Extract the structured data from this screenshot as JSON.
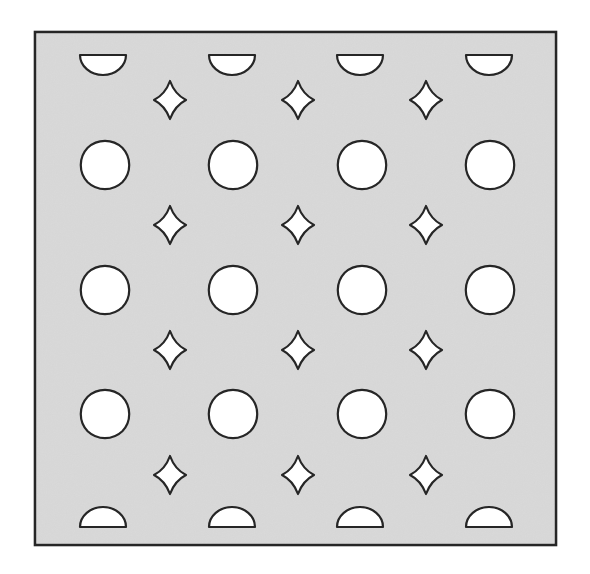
{
  "figure": {
    "title": "Decorative perforated panel pattern",
    "canvas": {
      "width": 590,
      "height": 574
    },
    "page_background": "#ffffff"
  },
  "panel": {
    "name": "perforated-panel",
    "x": 35,
    "y": 32,
    "width": 521,
    "height": 513,
    "fill": "#d9d9d9",
    "stroke": "#262626",
    "stroke_width": 2.6
  },
  "style": {
    "hole_fill": "#ffffff",
    "hole_stroke": "#262626",
    "hole_stroke_width": 2.2,
    "noise_opacity": 0.1
  },
  "pattern": {
    "quatrefoil": {
      "label": "quatrefoil-hole",
      "count": 12,
      "columns_x": [
        105,
        233,
        362,
        490
      ],
      "rows_y": [
        165,
        290,
        414
      ],
      "width": 94,
      "height": 90,
      "lobe_radius_ratio": 0.285
    },
    "star": {
      "label": "four-point-star-hole",
      "count": 12,
      "columns_x": [
        170,
        298,
        426
      ],
      "rows_y": [
        100,
        225,
        350,
        475
      ],
      "half_width": 16,
      "half_height": 19,
      "waist_ratio": 0.3
    },
    "half_circle_top": {
      "label": "half-circle-hole-top",
      "count": 4,
      "columns_x": [
        103,
        232,
        360,
        489
      ],
      "flat_y": 55,
      "radius_x": 23,
      "radius_y": 20,
      "orientation": "flat-top-curve-down"
    },
    "half_circle_bottom": {
      "label": "half-circle-hole-bottom",
      "count": 4,
      "columns_x": [
        103,
        232,
        360,
        489
      ],
      "flat_y": 527,
      "radius_x": 23,
      "radius_y": 20,
      "orientation": "curve-up-flat-bottom"
    }
  }
}
